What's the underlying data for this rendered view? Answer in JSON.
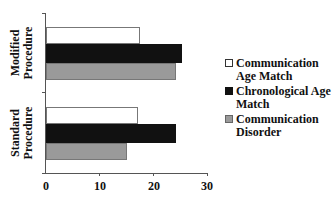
{
  "chart_data": {
    "type": "bar",
    "orientation": "horizontal",
    "title": "",
    "xlabel": "",
    "ylabel": "",
    "xlim": [
      0,
      30
    ],
    "x_ticks": [
      "0",
      "10",
      "20",
      "30"
    ],
    "categories": [
      "Modified Procedure",
      "Standard Procedure"
    ],
    "series": [
      {
        "name": "Communication Age Match",
        "color": "#ffffff",
        "values": [
          17.5,
          17.1
        ]
      },
      {
        "name": "Chronological Age Match",
        "color": "#111111",
        "values": [
          25.3,
          24.2
        ]
      },
      {
        "name": "Communication Disorder",
        "color": "#9a9a9a",
        "values": [
          24.2,
          15.1
        ]
      }
    ],
    "grid": false,
    "legend_position": "right"
  },
  "labels": {
    "cat0_line1": "Modified",
    "cat0_line2": "Procedure",
    "cat1_line1": "Standard",
    "cat1_line2": "Procedure",
    "legend": [
      {
        "line1": "Communication",
        "line2": "Age Match"
      },
      {
        "line1": "Chronological Age",
        "line2": "Match"
      },
      {
        "line1": "Communication",
        "line2": "Disorder"
      }
    ]
  }
}
